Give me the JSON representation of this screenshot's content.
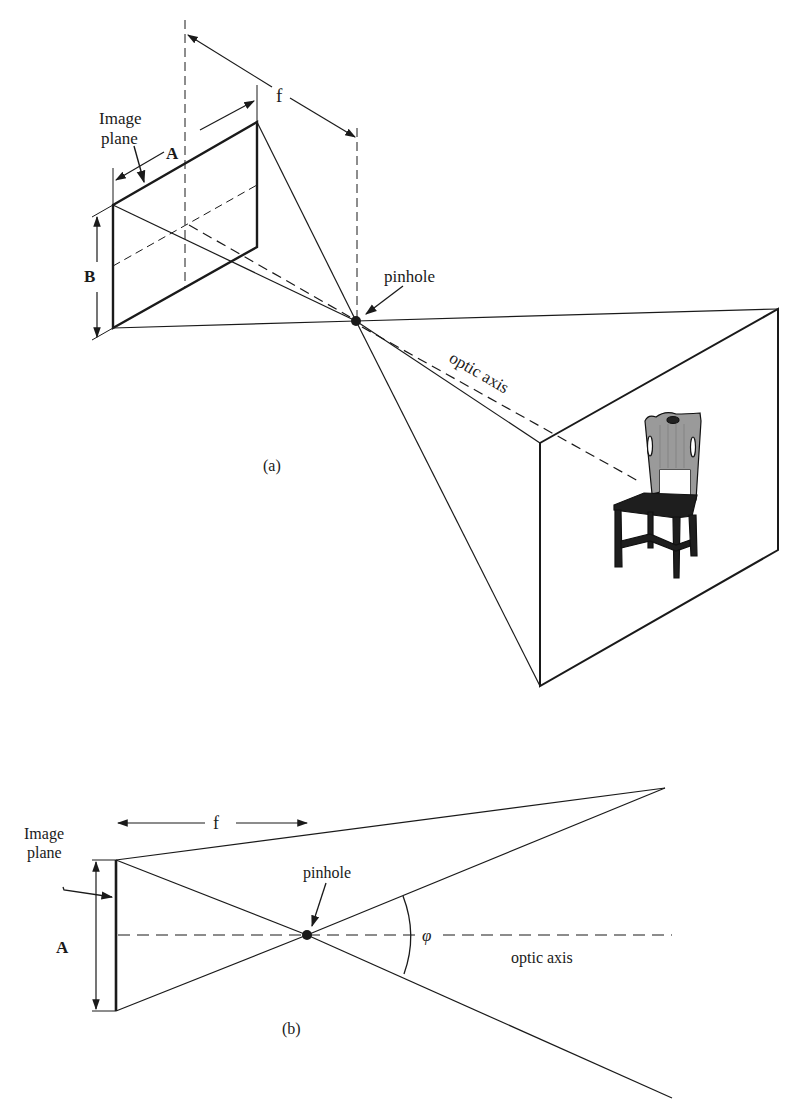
{
  "figure_a": {
    "caption": "(a)",
    "labels": {
      "image_plane_line1": "Image",
      "image_plane_line2": "plane",
      "width": "A",
      "height": "B",
      "focal_length": "f",
      "pinhole": "pinhole",
      "optic_axis": "optic axis"
    },
    "scene_object": "chair"
  },
  "figure_b": {
    "caption": "(b)",
    "labels": {
      "image_plane_line1": "Image",
      "image_plane_line2": "plane",
      "width": "A",
      "focal_length": "f",
      "pinhole": "pinhole",
      "angle": "φ",
      "optic_axis": "optic axis"
    }
  },
  "colors": {
    "ink": "#1a1a1a",
    "background": "#ffffff",
    "chair_back": "#9a9a9a"
  }
}
